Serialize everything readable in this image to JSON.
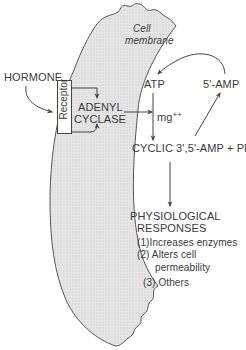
{
  "membrane": {
    "label_line1": "Cell",
    "label_line2": "membrane"
  },
  "hormone": {
    "label": "HORMONE"
  },
  "receptor": {
    "label": "Receptor"
  },
  "adenyl_cyclase": {
    "line1": "ADENYL",
    "line2": "CYCLASE"
  },
  "atp": {
    "label": "ATP"
  },
  "amp5": {
    "label": "5'-AMP"
  },
  "cofactor": {
    "label": "mg",
    "superscript": "++"
  },
  "cyclic_amp": {
    "label": "CYCLIC 3',5'-AMP + PPi"
  },
  "responses": {
    "title_line1": "PHYSIOLOGICAL",
    "title_line2": "RESPONSES",
    "items": [
      {
        "number": "(1)",
        "text": "Increases enzymes"
      },
      {
        "number": "(2)",
        "text": "Alters cell"
      },
      {
        "number": "",
        "text": "permeability"
      },
      {
        "number": "(3)",
        "text": "Others"
      }
    ]
  },
  "colors": {
    "line": "#444444",
    "membrane_fill": "#e4e4e4",
    "text": "#3a3a3a"
  }
}
